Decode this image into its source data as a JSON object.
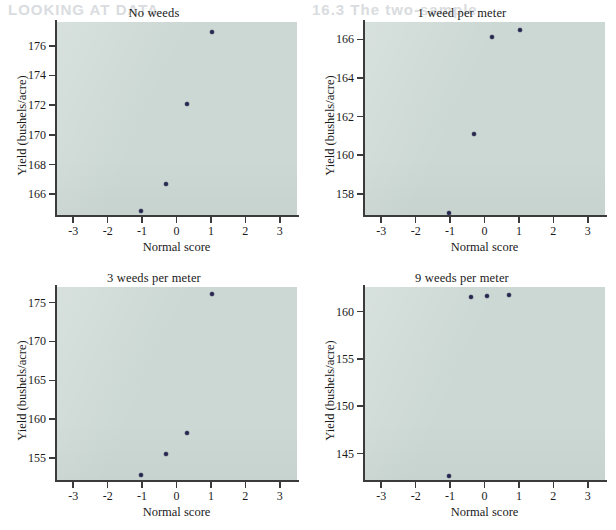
{
  "page": {
    "bleed_left": "LOOKING AT DATA",
    "bleed_right": "16.3 The two-sample"
  },
  "axis_titles": {
    "x": "Normal score",
    "y": "Yield (bushels/acre)"
  },
  "colors": {
    "plot_background": "#ccd8d4",
    "marker": "#26264f",
    "axis": "#3b3b3b",
    "page_background": "#ffffff"
  },
  "chart_data": [
    {
      "type": "scatter",
      "title": "No weeds",
      "xlabel": "Normal score",
      "ylabel": "Yield (bushels/acre)",
      "xlim": [
        -3.5,
        3.5
      ],
      "ylim": [
        164.6,
        177.6
      ],
      "xticks": [
        -3,
        -2,
        -1,
        0,
        1,
        2,
        3
      ],
      "xticklabels": [
        "-3",
        "-2",
        "-1",
        "0",
        "1",
        "2",
        "3"
      ],
      "yticks": [
        166,
        168,
        170,
        172,
        174,
        176
      ],
      "yticklabels": [
        "166",
        "168",
        "170",
        "172",
        "174",
        "176"
      ],
      "grid": false,
      "legend": "none",
      "points": [
        {
          "x": -1.03,
          "y": 164.9
        },
        {
          "x": -0.3,
          "y": 166.7
        },
        {
          "x": 0.3,
          "y": 172.1
        },
        {
          "x": 1.03,
          "y": 176.9
        }
      ]
    },
    {
      "type": "scatter",
      "title": "1 weed per meter",
      "xlabel": "Normal score",
      "ylabel": "Yield (bushels/acre)",
      "xlim": [
        -3.5,
        3.5
      ],
      "ylim": [
        156.9,
        166.9
      ],
      "xticks": [
        -3,
        -2,
        -1,
        0,
        1,
        2,
        3
      ],
      "xticklabels": [
        "-3",
        "-2",
        "-1",
        "0",
        "1",
        "2",
        "3"
      ],
      "yticks": [
        158,
        160,
        162,
        164,
        166
      ],
      "yticklabels": [
        "158",
        "160",
        "162",
        "164",
        "166"
      ],
      "grid": false,
      "legend": "none",
      "points": [
        {
          "x": -1.03,
          "y": 157.0
        },
        {
          "x": -0.3,
          "y": 161.1
        },
        {
          "x": 0.22,
          "y": 166.1
        },
        {
          "x": 1.03,
          "y": 166.5
        }
      ]
    },
    {
      "type": "scatter",
      "title": "3 weeds per meter",
      "xlabel": "Normal score",
      "ylabel": "Yield (bushels/acre)",
      "xlim": [
        -3.5,
        3.5
      ],
      "ylim": [
        152.2,
        177.0
      ],
      "xticks": [
        -3,
        -2,
        -1,
        0,
        1,
        2,
        3
      ],
      "xticklabels": [
        "-3",
        "-2",
        "-1",
        "0",
        "1",
        "2",
        "3"
      ],
      "yticks": [
        155,
        160,
        165,
        170,
        175
      ],
      "yticklabels": [
        "155",
        "160",
        "165",
        "170",
        "175"
      ],
      "grid": false,
      "legend": "none",
      "points": [
        {
          "x": -1.03,
          "y": 152.9
        },
        {
          "x": -0.3,
          "y": 155.6
        },
        {
          "x": 0.3,
          "y": 158.3
        },
        {
          "x": 1.03,
          "y": 176.1
        }
      ]
    },
    {
      "type": "scatter",
      "title": "9 weeds per meter",
      "xlabel": "Normal score",
      "ylabel": "Yield (bushels/acre)",
      "xlim": [
        -3.5,
        3.5
      ],
      "ylim": [
        142.2,
        162.6
      ],
      "xticks": [
        -3,
        -2,
        -1,
        0,
        1,
        2,
        3
      ],
      "xticklabels": [
        "-3",
        "-2",
        "-1",
        "0",
        "1",
        "2",
        "3"
      ],
      "yticks": [
        145,
        150,
        155,
        160
      ],
      "yticklabels": [
        "145",
        "150",
        "155",
        "160"
      ],
      "grid": false,
      "legend": "none",
      "points": [
        {
          "x": -1.03,
          "y": 142.6
        },
        {
          "x": -0.38,
          "y": 161.5
        },
        {
          "x": 0.06,
          "y": 161.7
        },
        {
          "x": 0.72,
          "y": 161.8
        }
      ]
    }
  ]
}
